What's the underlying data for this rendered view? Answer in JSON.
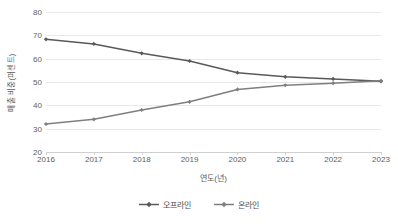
{
  "chart_data": {
    "type": "line",
    "title": "",
    "subtitle": "",
    "xlabel": "연도(년)",
    "ylabel": "매출 비중(퍼센트)",
    "categories": [
      "2016",
      "2017",
      "2018",
      "2019",
      "2020",
      "2021",
      "2022",
      "2023"
    ],
    "x": [
      2016,
      2017,
      2018,
      2019,
      2020,
      2021,
      2022,
      2023
    ],
    "series": [
      {
        "name": "오프라인",
        "color": "#595959",
        "marker": "diamond",
        "values": [
          68.3,
          66.3,
          62.3,
          59.0,
          54.0,
          52.2,
          51.3,
          50.3
        ]
      },
      {
        "name": "온라인",
        "color": "#7f7f7f",
        "marker": "diamond",
        "values": [
          32.0,
          34.0,
          38.0,
          41.5,
          46.8,
          48.6,
          49.5,
          50.5
        ]
      }
    ],
    "ylim": [
      20,
      80
    ],
    "yticks": [
      20,
      30,
      40,
      50,
      60,
      70,
      80
    ],
    "ytick_labels": [
      "20",
      "30",
      "40",
      "50",
      "60",
      "70",
      "80"
    ],
    "grid": true,
    "grid_axis": "y",
    "grid_color": "#e8e8e8",
    "legend_position": "bottom",
    "background": "#ffffff",
    "axis_color": "#d0d0d0",
    "text_color": "#5e5e5e"
  }
}
